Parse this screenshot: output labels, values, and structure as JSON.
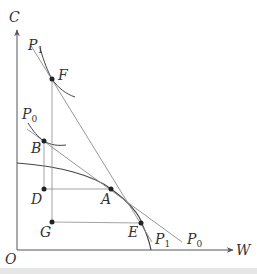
{
  "diagram": {
    "axes": {
      "y_label": "C",
      "x_label": "W",
      "origin_label": "O"
    },
    "points": [
      {
        "id": "F",
        "label": "F",
        "x": 52,
        "y": 79
      },
      {
        "id": "B",
        "label": "B",
        "x": 44,
        "y": 141
      },
      {
        "id": "D",
        "label": "D",
        "x": 44,
        "y": 189
      },
      {
        "id": "A",
        "label": "A",
        "x": 111,
        "y": 189
      },
      {
        "id": "G",
        "label": "G",
        "x": 52,
        "y": 222
      },
      {
        "id": "E",
        "label": "E",
        "x": 141,
        "y": 223
      }
    ],
    "lines": {
      "p1_upper": {
        "label": "P",
        "sub": "1"
      },
      "p0_upper": {
        "label": "P",
        "sub": "0"
      },
      "p1_lower": {
        "label": "P",
        "sub": "1"
      },
      "p0_lower": {
        "label": "P",
        "sub": "0"
      }
    },
    "colors": {
      "axis": "#555555",
      "curve": "#444444",
      "budget_line": "#8c8c8c",
      "guide_line": "#8c8c8c",
      "point": "#222222"
    }
  }
}
